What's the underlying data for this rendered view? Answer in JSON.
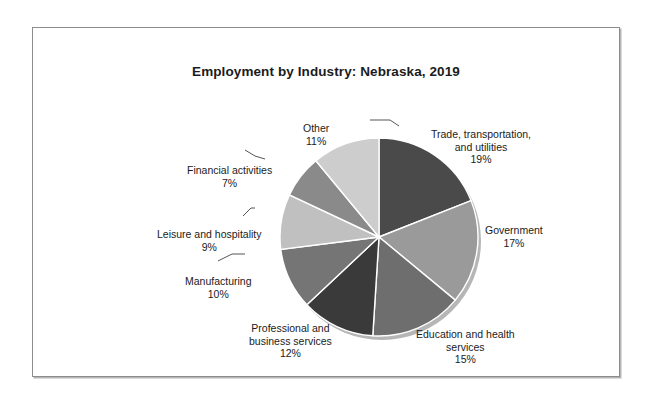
{
  "chart_data": {
    "type": "pie",
    "title": "Employment by Industry: Nebraska, 2019",
    "xlabel": "",
    "ylabel": "",
    "legend_position": "none",
    "grid": false,
    "value_unit": "%",
    "categories": [
      "Trade, transportation, and utilities",
      "Government",
      "Education and health services",
      "Professional and business services",
      "Manufacturing",
      "Leisure and hospitality",
      "Financial activities",
      "Other"
    ],
    "values": [
      19,
      17,
      15,
      12,
      10,
      9,
      7,
      11
    ],
    "colors": [
      "#4a4a4a",
      "#9a9a9a",
      "#6e6e6e",
      "#3a3a3a",
      "#757575",
      "#c0c0c0",
      "#8a8a8a",
      "#cdcdcd"
    ],
    "slices": [
      {
        "label": "Trade, transportation,",
        "label_line2": "and utilities",
        "value": "19%",
        "color": "#4a4a4a"
      },
      {
        "label": "Government",
        "label_line2": "",
        "value": "17%",
        "color": "#9a9a9a"
      },
      {
        "label": "Education and health",
        "label_line2": "services",
        "value": "15%",
        "color": "#6e6e6e"
      },
      {
        "label": "Professional and",
        "label_line2": "business services",
        "value": "12%",
        "color": "#3a3a3a"
      },
      {
        "label": "Manufacturing",
        "label_line2": "",
        "value": "10%",
        "color": "#757575"
      },
      {
        "label": "Leisure and hospitality",
        "label_line2": "",
        "value": "9%",
        "color": "#c0c0c0"
      },
      {
        "label": "Financial activities",
        "label_line2": "",
        "value": "7%",
        "color": "#8a8a8a"
      },
      {
        "label": "Other",
        "label_line2": "",
        "value": "11%",
        "color": "#cdcdcd"
      }
    ]
  },
  "labels": {
    "trade_l1": "Trade, transportation,",
    "trade_l2": "and utilities",
    "trade_pct": "19%",
    "government_l1": "Government",
    "government_pct": "17%",
    "education_l1": "Education and health",
    "education_l2": "services",
    "education_pct": "15%",
    "professional_l1": "Professional and",
    "professional_l2": "business services",
    "professional_pct": "12%",
    "manufacturing_l1": "Manufacturing",
    "manufacturing_pct": "10%",
    "leisure_l1": "Leisure and hospitality",
    "leisure_pct": "9%",
    "financial_l1": "Financial activities",
    "financial_pct": "7%",
    "other_l1": "Other",
    "other_pct": "11%"
  }
}
